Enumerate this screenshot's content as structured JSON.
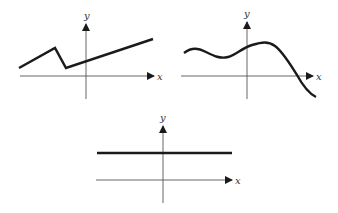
{
  "figure": {
    "graphs": [
      {
        "id": "graph-1",
        "x_label": "x",
        "y_label": "y",
        "description": "Piecewise linear function with a jump/corner (zig-zag)"
      },
      {
        "id": "graph-2",
        "x_label": "x",
        "y_label": "y",
        "description": "Smooth wavy curve crossing x-axis on the right"
      },
      {
        "id": "graph-3",
        "x_label": "x",
        "y_label": "y",
        "description": "Horizontal line (constant function) above x-axis"
      }
    ],
    "colors": {
      "curve": "#1a1a1a",
      "axis": "#555555",
      "label": "#333333"
    }
  }
}
